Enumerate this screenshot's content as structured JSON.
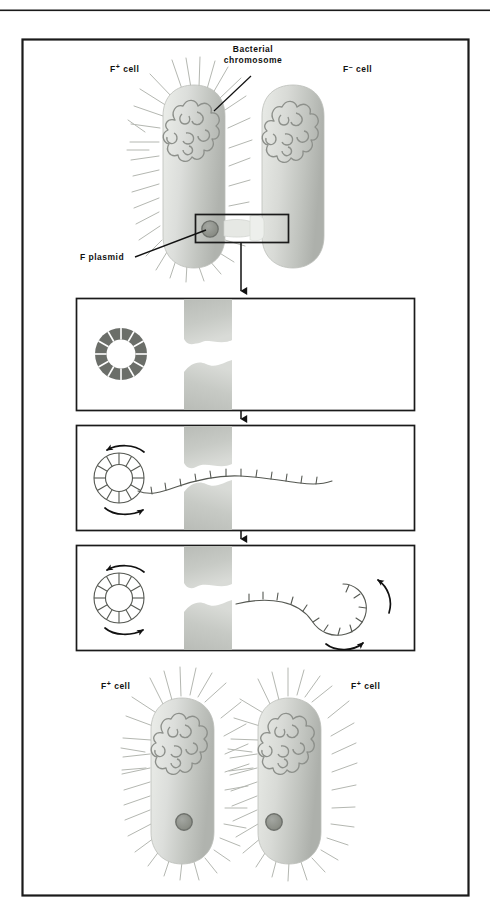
{
  "figure": {
    "frame_color": "#1a1a1a",
    "background_color": "#ffffff"
  },
  "colors": {
    "cell_fill_light": "#e8e9e6",
    "cell_fill_mid": "#c9cbc6",
    "cell_fill_dark": "#a9aca6",
    "chromosome_stroke": "#8a8d88",
    "plasmid_fill": "#8e918c",
    "plasmid_stroke": "#6f726d",
    "pilus_stroke": "#b3b6b0",
    "panel_border": "#1a1a1a",
    "arrow_color": "#111111",
    "text_color": "#111111",
    "ring_dark_fill": "#6b6e69",
    "ring_light_fill": "#ffffff"
  },
  "top_scene": {
    "name": "conjugation-start",
    "donor_label": {
      "base": "F",
      "sup": "+",
      "suffix": " cell"
    },
    "recipient_label": {
      "base": "F",
      "sup": "–",
      "suffix": " cell"
    },
    "chromosome_label_line1": "Bacterial",
    "chromosome_label_line2": "chromosome",
    "plasmid_label": "F  plasmid",
    "callout_box_caption": "magnified conjugation bridge"
  },
  "panels": [
    {
      "id": "panel-1",
      "step": 1,
      "caption": "F plasmid is a closed circular double-stranded DNA molecule inside the donor cell; the conjugation bridge forms between the two cells",
      "ring_style": "solid-segmented",
      "ring_segments": 12,
      "has_rotation_arrows": false,
      "has_transferred_strand": false,
      "has_recipient_circle": false
    },
    {
      "id": "panel-2",
      "step": 2,
      "caption": "One strand of the F plasmid is nicked and begins to unwind, passing through the conjugation bridge into the recipient cell",
      "ring_style": "outline-segmented",
      "ring_segments": 12,
      "has_rotation_arrows": true,
      "has_transferred_strand": true,
      "has_recipient_circle": false
    },
    {
      "id": "panel-3",
      "step": 3,
      "caption": "The transferred strand circularizes in the recipient cell as rolling-circle replication continues in the donor",
      "ring_style": "outline-segmented",
      "ring_segments": 12,
      "has_rotation_arrows": true,
      "has_transferred_strand": true,
      "has_recipient_circle": true
    }
  ],
  "bottom_scene": {
    "name": "conjugation-result",
    "left_label": {
      "base": "F",
      "sup": "+",
      "suffix": " cell"
    },
    "right_label": {
      "base": "F",
      "sup": "+",
      "suffix": " cell"
    },
    "caption": "Both cells are now F-positive donors, each carrying a copy of the F plasmid and expressing sex pili"
  }
}
